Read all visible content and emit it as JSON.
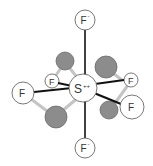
{
  "diagram": {
    "central_atom": {
      "label": "S",
      "charge": "++"
    },
    "atoms": [
      {
        "id": "f-top",
        "label": "F",
        "charge": "-"
      },
      {
        "id": "f-bottom",
        "label": "F",
        "charge": "-"
      },
      {
        "id": "f-left",
        "label": "F",
        "charge": ""
      },
      {
        "id": "f-back-left",
        "label": "F",
        "charge": ""
      },
      {
        "id": "f-back-right",
        "label": "F",
        "charge": ""
      },
      {
        "id": "f-right",
        "label": "F",
        "charge": ""
      }
    ],
    "lone_pair_spheres": 4,
    "colors": {
      "bond": "#111111",
      "back_bond": "#bbbbbb",
      "atom_fill": "#ffffff",
      "atom_stroke": "#555555",
      "sphere_fill": "#8a8a8a"
    }
  }
}
